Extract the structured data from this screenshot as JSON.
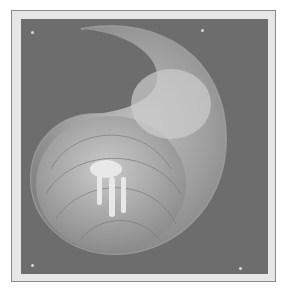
{
  "image": {
    "subject": "nautilus shell cross-section with hermit crab",
    "colors": {
      "frame": "#e6e6e6",
      "frame_border": "#8a8a8a",
      "background": "#6d6d6d",
      "shell_light": "#b8b8b8",
      "shell_mid": "#949494"
    }
  }
}
